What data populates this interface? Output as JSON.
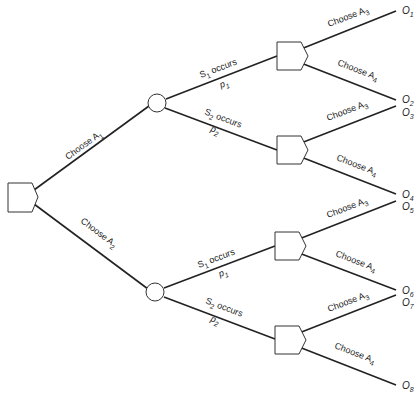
{
  "diagram": {
    "type": "decision-tree",
    "root": {
      "label": "decision node"
    },
    "branches": {
      "a1": {
        "label": "Choose A",
        "sub": "1"
      },
      "a2": {
        "label": "Choose A",
        "sub": "2"
      }
    },
    "chance_upper": {
      "s1": {
        "label": "S",
        "sub": "1",
        "suffix": " occurs",
        "p": "p",
        "psub": "1"
      },
      "s2": {
        "label": "S",
        "sub": "2",
        "suffix": " occurs",
        "p": "p",
        "psub": "2"
      }
    },
    "chance_lower": {
      "s1": {
        "label": "S",
        "sub": "1",
        "suffix": " occurs",
        "p": "p",
        "psub": "1"
      },
      "s2": {
        "label": "S",
        "sub": "2",
        "suffix": " occurs",
        "p": "p",
        "psub": "2"
      }
    },
    "choices": [
      {
        "label": "Choose A",
        "sub": "3"
      },
      {
        "label": "Choose A",
        "sub": "4"
      },
      {
        "label": "Choose A",
        "sub": "3"
      },
      {
        "label": "Choose A",
        "sub": "4"
      },
      {
        "label": "Choose A",
        "sub": "3"
      },
      {
        "label": "Choose A",
        "sub": "4"
      },
      {
        "label": "Choose A",
        "sub": "3"
      },
      {
        "label": "Choose A",
        "sub": "4"
      }
    ],
    "outcomes": [
      {
        "label": "O",
        "sub": "1"
      },
      {
        "label": "O",
        "sub": "2"
      },
      {
        "label": "O",
        "sub": "3"
      },
      {
        "label": "O",
        "sub": "4"
      },
      {
        "label": "O",
        "sub": "5"
      },
      {
        "label": "O",
        "sub": "6"
      },
      {
        "label": "O",
        "sub": "7"
      },
      {
        "label": "O",
        "sub": "8"
      }
    ]
  }
}
